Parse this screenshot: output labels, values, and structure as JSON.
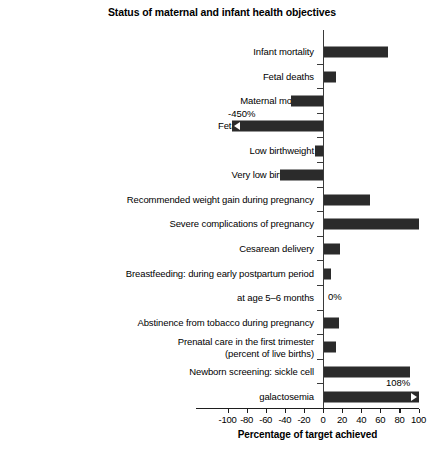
{
  "chart_data": {
    "type": "bar",
    "orientation": "horizontal",
    "title": "Status of maternal and infant health objectives",
    "xlabel": "Percentage of target achieved",
    "ylabel": "",
    "xlim": [
      -100,
      100
    ],
    "xticks": [
      -100,
      -80,
      -60,
      -40,
      -20,
      0,
      20,
      40,
      60,
      80,
      100
    ],
    "xticklabels": [
      "-100",
      "-80",
      "-60",
      "-40",
      "-20",
      "0",
      "20",
      "40",
      "60",
      "80",
      "100"
    ],
    "grid": false,
    "legend": null,
    "bar_color": "#2b2b2b",
    "axis_color": "#1e1e1e",
    "categories": [
      "Infant mortality",
      "Fetal deaths",
      "Maternal mortality",
      "Fetal alcohol syndrome",
      "Low birthweight",
      "Very low birthweight",
      "Recommended weight gain during pregnancy",
      "Severe complications of pregnancy",
      "Cesarean delivery",
      "Breastfeeding: during early postpartum period",
      "at age 5–6 months",
      "Abstinence from tobacco during pregnancy",
      "Prenatal care in the first trimester\n(percent of live births)",
      "Newborn screening: sickle cell",
      "galactosemia"
    ],
    "values": [
      67,
      13,
      -33,
      -450,
      -8,
      -45,
      48,
      100,
      17,
      7,
      0,
      16,
      13,
      90,
      108
    ],
    "annotations": [
      {
        "category": "Fetal alcohol syndrome",
        "text": "-450%",
        "note": "off-scale, bar clipped with left arrow"
      },
      {
        "category": "at age 5–6 months",
        "text": "0%",
        "note": "zero-length bar"
      },
      {
        "category": "galactosemia",
        "text": "108%",
        "note": "off-scale, bar clipped with right arrow"
      }
    ]
  },
  "rows": [
    {
      "label": "Infant mortality",
      "value": 67,
      "annot": "",
      "clip": "none"
    },
    {
      "label": "Fetal deaths",
      "value": 13,
      "annot": "",
      "clip": "none"
    },
    {
      "label": "Maternal mortality",
      "value": -33,
      "annot": "",
      "clip": "none"
    },
    {
      "label": "Fetal alcohol syndrome",
      "value": -450,
      "annot": "-450%",
      "clip": "left"
    },
    {
      "label": "Low birthweight",
      "value": -8,
      "annot": "",
      "clip": "none"
    },
    {
      "label": "Very low birthweight",
      "value": -45,
      "annot": "",
      "clip": "none"
    },
    {
      "label": "Recommended weight gain during pregnancy",
      "value": 48,
      "annot": "",
      "clip": "none"
    },
    {
      "label": "Severe complications of pregnancy",
      "value": 100,
      "annot": "",
      "clip": "none"
    },
    {
      "label": "Cesarean delivery",
      "value": 17,
      "annot": "",
      "clip": "none"
    },
    {
      "label": "Breastfeeding: during early postpartum period",
      "value": 7,
      "annot": "",
      "clip": "none"
    },
    {
      "label": "at age 5–6 months",
      "value": 0,
      "annot": "0%",
      "clip": "none"
    },
    {
      "label": "Abstinence from tobacco during pregnancy",
      "value": 16,
      "annot": "",
      "clip": "none"
    },
    {
      "label": "Prenatal care in the first trimester\n(percent of live births)",
      "value": 13,
      "annot": "",
      "clip": "none"
    },
    {
      "label": "Newborn screening: sickle cell",
      "value": 90,
      "annot": "",
      "clip": "none"
    },
    {
      "label": "galactosemia",
      "value": 108,
      "annot": "108%",
      "clip": "right"
    }
  ]
}
